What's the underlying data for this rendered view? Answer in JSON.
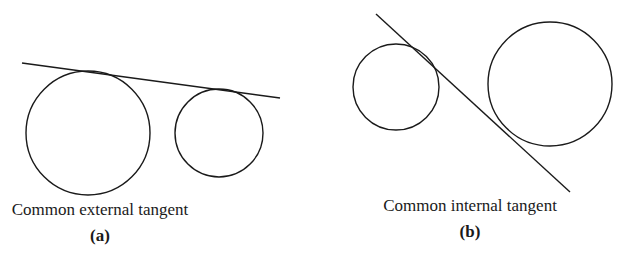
{
  "figure_a": {
    "caption": "Common external tangent",
    "label": "(a)",
    "circles": [
      {
        "cx": 88,
        "cy": 133,
        "r": 62
      },
      {
        "cx": 219,
        "cy": 133,
        "r": 44
      }
    ],
    "tangent_line": {
      "x1": 22,
      "y1": 63,
      "x2": 280,
      "y2": 98
    }
  },
  "figure_b": {
    "caption": "Common internal tangent",
    "label": "(b)",
    "circles": [
      {
        "cx": 396,
        "cy": 87,
        "r": 43
      },
      {
        "cx": 550,
        "cy": 84,
        "r": 62
      }
    ],
    "tangent_line": {
      "x1": 376,
      "y1": 14,
      "x2": 570,
      "y2": 192
    }
  },
  "colors": {
    "stroke": "#1a1a1a",
    "background": "#ffffff"
  }
}
